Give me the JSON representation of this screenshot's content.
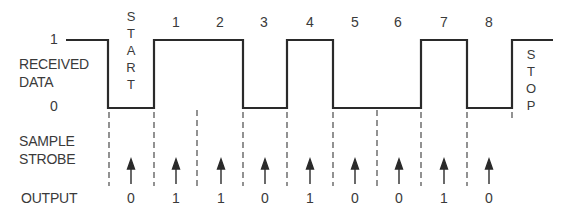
{
  "diagram": {
    "level_high_label": "1",
    "level_low_label": "0",
    "signal_label_line1": "RECEIVED",
    "signal_label_line2": "DATA",
    "strobe_label_line1": "SAMPLE",
    "strobe_label_line2": "STROBE",
    "output_label": "OUTPUT",
    "start_bit_letters": [
      "S",
      "T",
      "A",
      "R",
      "T"
    ],
    "stop_bit_letters": [
      "S",
      "T",
      "O",
      "P"
    ],
    "bit_numbers": [
      "1",
      "2",
      "3",
      "4",
      "5",
      "6",
      "7",
      "8"
    ],
    "waveform_levels": [
      "idle-1",
      "start-0",
      "1",
      "1",
      "0",
      "1",
      "0",
      "0",
      "1",
      "0",
      "stop-1"
    ],
    "output_values": [
      "0",
      "1",
      "1",
      "0",
      "1",
      "0",
      "0",
      "1",
      "0"
    ],
    "colors": {
      "line": "#2a2a2a",
      "text": "#3a3a3a",
      "dashed": "#4a4a4a",
      "background": "#ffffff"
    }
  }
}
